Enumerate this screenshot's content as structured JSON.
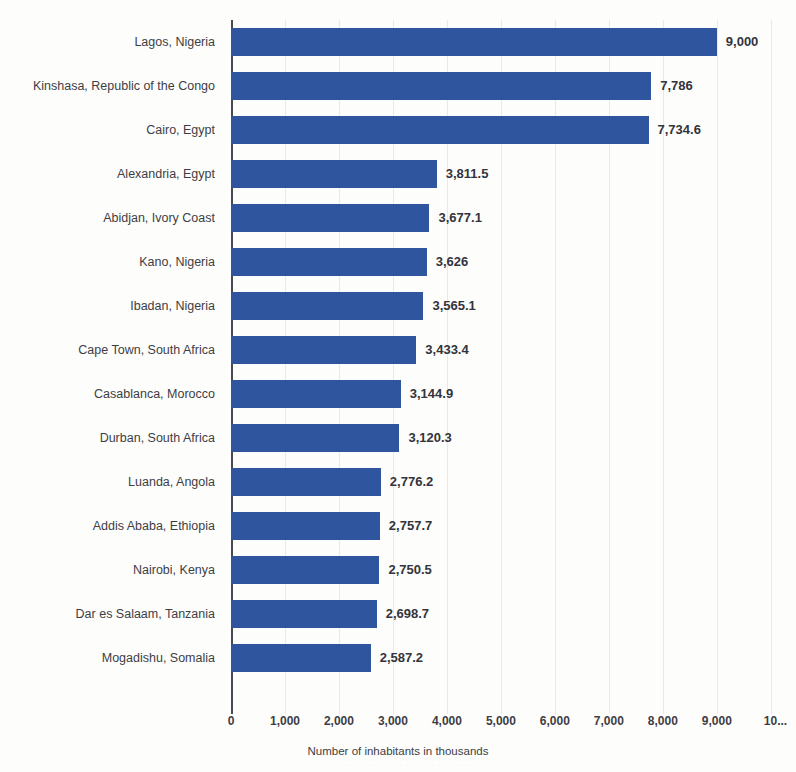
{
  "chart_data": {
    "type": "bar",
    "orientation": "horizontal",
    "title": "",
    "xlabel": "Number of inhabitants in thousands",
    "ylabel": "",
    "xlim": [
      0,
      10300
    ],
    "grid": true,
    "legend": "none",
    "bar_color": "#2f559f",
    "categories": [
      "Lagos, Nigeria",
      "Kinshasa, Republic of the Congo",
      "Cairo, Egypt",
      "Alexandria, Egypt",
      "Abidjan, Ivory Coast",
      "Kano, Nigeria",
      "Ibadan, Nigeria",
      "Cape Town, South Africa",
      "Casablanca, Morocco",
      "Durban, South Africa",
      "Luanda, Angola",
      "Addis Ababa, Ethiopia",
      "Nairobi, Kenya",
      "Dar es Salaam, Tanzania",
      "Mogadishu, Somalia"
    ],
    "values": [
      9000,
      7786,
      7734.6,
      3811.5,
      3677.1,
      3626,
      3565.1,
      3433.4,
      3144.9,
      3120.3,
      2776.2,
      2757.7,
      2750.5,
      2698.7,
      2587.2
    ],
    "value_labels": [
      "9,000",
      "7,786",
      "7,734.6",
      "3,811.5",
      "3,677.1",
      "3,626",
      "3,565.1",
      "3,433.4",
      "3,144.9",
      "3,120.3",
      "2,776.2",
      "2,757.7",
      "2,750.5",
      "2,698.7",
      "2,587.2"
    ],
    "xticks": [
      0,
      1000,
      2000,
      3000,
      4000,
      5000,
      6000,
      7000,
      8000,
      9000,
      10000
    ],
    "xtick_labels": [
      "0",
      "1,000",
      "2,000",
      "3,000",
      "4,000",
      "5,000",
      "6,000",
      "7,000",
      "8,000",
      "9,000",
      "10..."
    ]
  },
  "footer": {
    "ghost_caption": "· · · · · · · · · · · · · · · · · · · · · · · ·"
  }
}
